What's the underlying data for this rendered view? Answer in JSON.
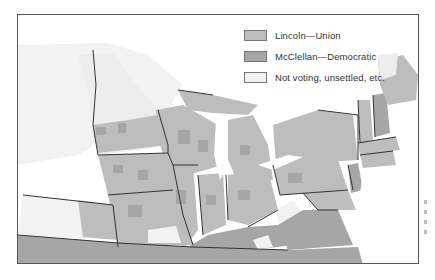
{
  "legend": {
    "items": [
      {
        "label": "Lincoln—Union",
        "color": "#bdbdbd",
        "key": "lincoln"
      },
      {
        "label": "McClellan—Democratic",
        "color": "#a6a6a6",
        "key": "mcclellan"
      },
      {
        "label": "Not voting, unsettled, etc.",
        "color": "#f2f2f2",
        "key": "not-voting"
      }
    ]
  },
  "colors": {
    "lincoln": "#bdbdbd",
    "mcclellan": "#a6a6a6",
    "not_voting": "#f2f2f2",
    "water": "#ffffff",
    "border": "#333333",
    "frame": "#555555"
  }
}
